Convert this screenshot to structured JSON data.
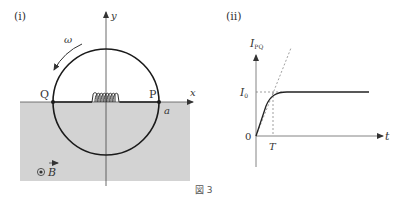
{
  "figure": {
    "caption": "図 3",
    "panel_i": {
      "label": "(i)",
      "axis_x": "x",
      "axis_y": "y",
      "omega": "ω",
      "point_Q": "Q",
      "point_P": "P",
      "radius_label": "a",
      "field_label": "B",
      "field_symbol": "⊙",
      "colors": {
        "region": "#d3d3d3",
        "ring": "#1a1a1a",
        "axis": "#444444"
      }
    },
    "panel_ii": {
      "label": "(ii)",
      "y_label_main": "I",
      "y_label_sub": "PQ",
      "x_label": "t",
      "level_main": "I",
      "level_sub": "0",
      "origin": "0",
      "time_mark": "T"
    }
  }
}
